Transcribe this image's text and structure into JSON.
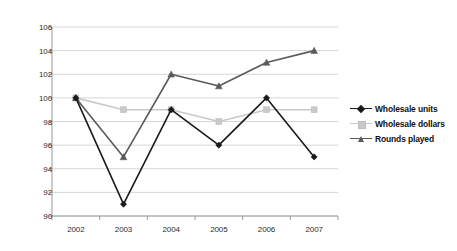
{
  "chart_data": {
    "type": "line",
    "title": "",
    "xlabel": "",
    "ylabel": "Indexed value",
    "categories": [
      "2002",
      "2003",
      "2004",
      "2005",
      "2006",
      "2007"
    ],
    "ylim": [
      90,
      106
    ],
    "yticks": [
      90,
      92,
      94,
      96,
      98,
      100,
      102,
      104,
      106
    ],
    "grid": true,
    "legend_position": "right",
    "series": [
      {
        "name": "Wholesale units",
        "color": "#1a1a1a",
        "marker": "diamond",
        "values": [
          100,
          91,
          99,
          96,
          100,
          95
        ]
      },
      {
        "name": "Wholesale dollars",
        "color": "#c9c9c9",
        "marker": "square",
        "values": [
          100,
          99,
          99,
          98,
          99,
          99
        ]
      },
      {
        "name": "Rounds played",
        "color": "#5a5a5a",
        "marker": "triangle",
        "values": [
          100,
          95,
          102,
          101,
          103,
          104
        ]
      }
    ]
  },
  "axis": {
    "y_title": "Indexed value"
  },
  "legend": {
    "items": [
      {
        "label": "Wholesale units"
      },
      {
        "label": "Wholesale dollars"
      },
      {
        "label": "Rounds played"
      }
    ]
  },
  "style": {
    "background": "#ffffff",
    "grid_color": "#d6d6d6",
    "axis_color": "#9a9a9a",
    "tick_text_color": "#2b2b2b"
  }
}
